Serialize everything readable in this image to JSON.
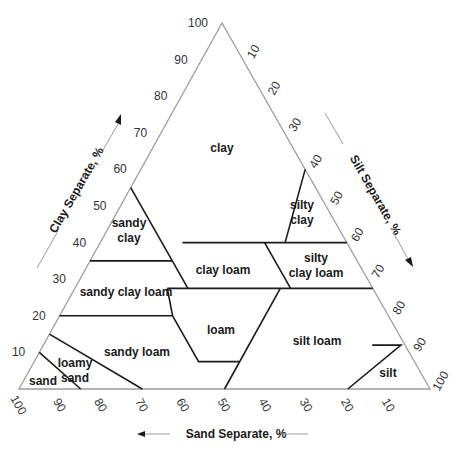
{
  "diagram": {
    "colors": {
      "frame": "#9a9a9a",
      "boundary": "#1a1a1a",
      "text": "#1a1a1a",
      "background": "#ffffff"
    },
    "axes": {
      "clay": {
        "title": "Clay Separate, %",
        "ticks": [
          "10",
          "20",
          "30",
          "40",
          "50",
          "60",
          "70",
          "80",
          "90",
          "100"
        ]
      },
      "silt": {
        "title": "Silt Separate, %",
        "ticks": [
          "10",
          "20",
          "30",
          "40",
          "50",
          "60",
          "70",
          "80",
          "90",
          "100"
        ]
      },
      "sand": {
        "title": "Sand Separate, %",
        "ticks": [
          "100",
          "90",
          "80",
          "70",
          "60",
          "50",
          "40",
          "30",
          "20",
          "10"
        ]
      }
    },
    "classes": [
      {
        "name": "clay",
        "lines": [
          "clay"
        ],
        "x": 222,
        "y": 148
      },
      {
        "name": "sandy clay",
        "lines": [
          "sandy",
          "clay"
        ],
        "x": 129,
        "y": 230
      },
      {
        "name": "silty clay",
        "lines": [
          "silty",
          "clay"
        ],
        "x": 302,
        "y": 212
      },
      {
        "name": "clay loam",
        "lines": [
          "clay loam"
        ],
        "x": 223,
        "y": 270
      },
      {
        "name": "silty clay loam",
        "lines": [
          "silty",
          "clay loam"
        ],
        "x": 316,
        "y": 265
      },
      {
        "name": "sandy clay loam",
        "lines": [
          "sandy clay loam"
        ],
        "x": 126,
        "y": 292
      },
      {
        "name": "loam",
        "lines": [
          "loam"
        ],
        "x": 221,
        "y": 330
      },
      {
        "name": "silt loam",
        "lines": [
          "silt loam"
        ],
        "x": 317,
        "y": 341
      },
      {
        "name": "sandy loam",
        "lines": [
          "sandy loam"
        ],
        "x": 137,
        "y": 352
      },
      {
        "name": "loamy sand",
        "lines": [
          "loamy",
          "sand"
        ],
        "x": 75,
        "y": 370
      },
      {
        "name": "sand",
        "lines": [
          "sand"
        ],
        "x": 43,
        "y": 381
      },
      {
        "name": "silt",
        "lines": [
          "silt"
        ],
        "x": 388,
        "y": 373
      }
    ]
  }
}
